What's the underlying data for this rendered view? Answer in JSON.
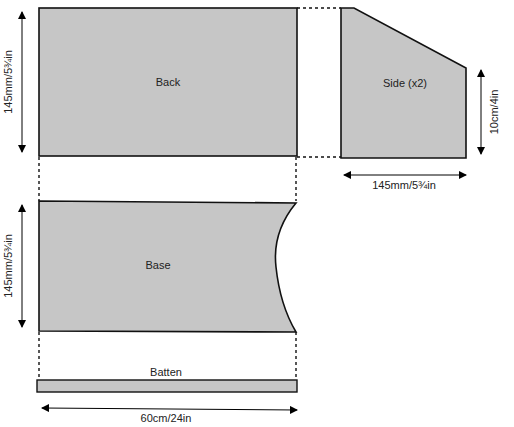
{
  "diagram": {
    "fill_color": "#c6c6c6",
    "stroke_color": "#111111",
    "pieces": {
      "back": {
        "label": "Back"
      },
      "side": {
        "label": "Side (x2)"
      },
      "base": {
        "label": "Base"
      },
      "batten": {
        "label": "Batten"
      }
    },
    "dimensions": {
      "back_height": "145mm/5¾in",
      "base_height": "145mm/5¾in",
      "side_height": "10cm/4in",
      "side_width": "145mm/5¾in",
      "overall_width": "60cm/24in"
    }
  }
}
